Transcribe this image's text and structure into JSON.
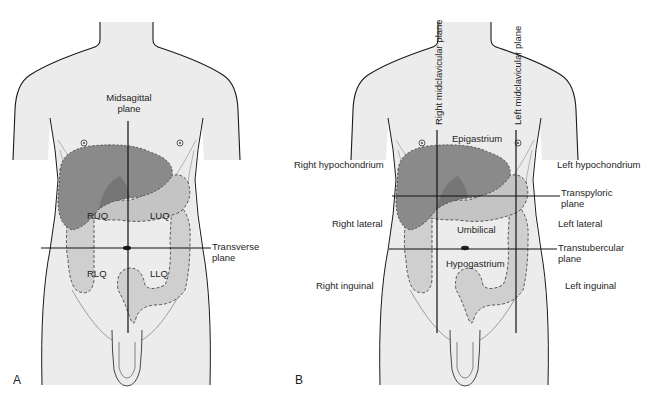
{
  "figure": {
    "panel_a": {
      "letter": "A",
      "labels": {
        "midsagittal": [
          "Midsagittal",
          "plane"
        ],
        "transverse": [
          "Transverse",
          "plane"
        ],
        "ruq": "RUQ",
        "luq": "LUQ",
        "rlq": "RLQ",
        "llq": "LLQ"
      }
    },
    "panel_b": {
      "letter": "B",
      "labels": {
        "right_midclavicular": "Right midclavicular plane",
        "left_midclavicular": "Left midclavicular plane",
        "epigastrium": "Epigastrium",
        "right_hypochondrium": "Right hypochondrium",
        "left_hypochondrium": "Left hypochondrium",
        "transpyloric": [
          "Transpyloric",
          "plane"
        ],
        "right_lateral": "Right lateral",
        "left_lateral": "Left lateral",
        "umbilical": "Umbilical",
        "transtubercular": [
          "Transtubercular",
          "plane"
        ],
        "hypogastrium": "Hypogastrium",
        "right_inguinal": "Right inguinal",
        "left_inguinal": "Left inguinal"
      }
    },
    "colors": {
      "skin": "#ececec",
      "liver": "#8a8a8a",
      "liver_dark": "#6e6e6e",
      "stomach": "#c4c4c4",
      "bowel": "#cfcfcf",
      "outline": "#1a1a1a"
    }
  }
}
